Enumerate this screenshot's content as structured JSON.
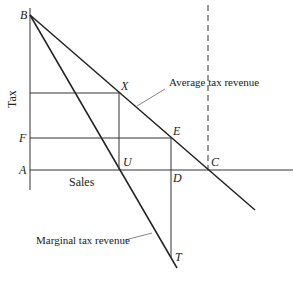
{
  "diagram": {
    "axes": {
      "y_label": "Tax",
      "x_label": "Sales"
    },
    "points": {
      "B": "B",
      "X": "X",
      "E": "E",
      "F": "F",
      "A": "A",
      "U": "U",
      "D": "D",
      "C": "C",
      "T": "T"
    },
    "curves": {
      "average": "Average tax revenue",
      "marginal": "Marginal tax revenue"
    },
    "colors": {
      "line": "#222222",
      "leader": "#555555",
      "background": "#ffffff"
    }
  }
}
